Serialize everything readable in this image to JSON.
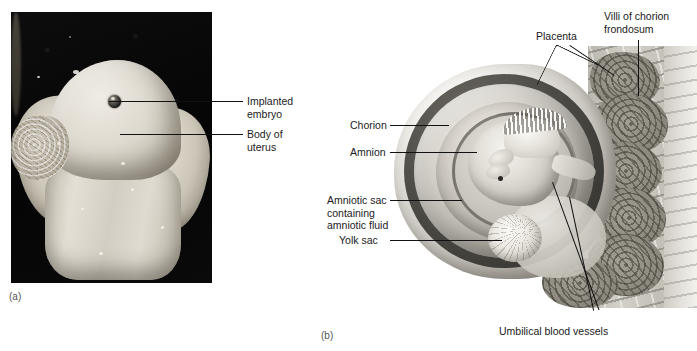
{
  "figure": {
    "panels": [
      {
        "id": "a",
        "caption": "(a)",
        "type": "photograph"
      },
      {
        "id": "b",
        "caption": "(b)",
        "type": "illustration"
      }
    ]
  },
  "panel_a": {
    "caption": "(a)",
    "labels": [
      {
        "id": "implanted-embryo",
        "text": "Implanted\nembryo"
      },
      {
        "id": "body-of-uterus",
        "text": "Body of\nuterus"
      }
    ]
  },
  "panel_b": {
    "caption": "(b)",
    "labels": [
      {
        "id": "placenta",
        "text": "Placenta"
      },
      {
        "id": "villi-of-chorion-frondosum",
        "text": "Villi of chorion\nfrondosum"
      },
      {
        "id": "chorion",
        "text": "Chorion"
      },
      {
        "id": "amnion",
        "text": "Amnion"
      },
      {
        "id": "amniotic-sac",
        "text": "Amniotic sac\ncontaining\namniotic fluid"
      },
      {
        "id": "yolk-sac",
        "text": "Yolk sac"
      },
      {
        "id": "umbilical-blood-vessels",
        "text": "Umbilical blood vessels"
      }
    ]
  },
  "colors": {
    "background": "#ffffff",
    "text": "#1a1a1a",
    "caption": "#555555",
    "leader_line": "#111111",
    "photo_background": "#060606",
    "specimen": "#d9d5cc"
  }
}
